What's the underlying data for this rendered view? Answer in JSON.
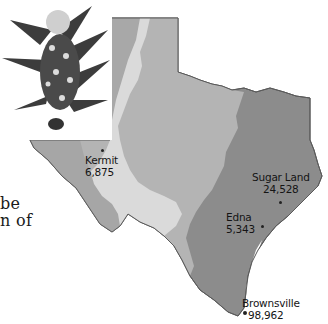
{
  "figure": {
    "colors": {
      "background": "#ffffff",
      "region_east": "#8c8c8c",
      "region_central": "#b4b4b4",
      "region_west_plateau": "#d8d8d8",
      "region_west": "#a6a6a6",
      "outline": "#5a5a5a",
      "text": "#141414"
    },
    "body_text_fragments": [
      "be",
      "n of"
    ],
    "cities": [
      {
        "name": "Kermit",
        "population": "6,875"
      },
      {
        "name": "Sugar Land",
        "population": "24,528"
      },
      {
        "name": "Edna",
        "population": "5,343"
      },
      {
        "name": "Brownsville",
        "population": "98,962"
      }
    ],
    "photo": {
      "description": "bluebonnet flower"
    }
  }
}
